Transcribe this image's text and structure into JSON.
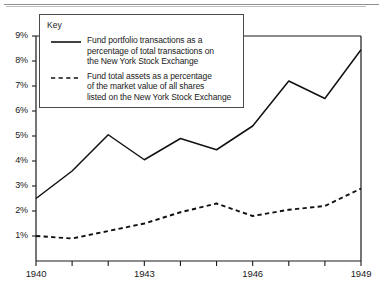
{
  "chart_data": {
    "type": "line",
    "title": "",
    "subtitle": "",
    "xlabel": "",
    "ylabel": "",
    "xlim": [
      1940,
      1949
    ],
    "ylim": [
      0,
      9
    ],
    "grid": false,
    "legend_position": "top-left",
    "legend_title": "Key",
    "x": [
      1940,
      1941,
      1942,
      1943,
      1944,
      1945,
      1946,
      1947,
      1948,
      1949
    ],
    "x_tick_labels": [
      "1940",
      "1943",
      "1946",
      "1949"
    ],
    "x_tick_values": [
      1940,
      1943,
      1946,
      1949
    ],
    "x_minor_ticks": [
      1941,
      1942,
      1944,
      1945,
      1947,
      1948
    ],
    "y_tick_labels": [
      "1%",
      "2%",
      "3%",
      "4%",
      "5%",
      "6%",
      "7%",
      "8%",
      "9%"
    ],
    "y_tick_values": [
      1,
      2,
      3,
      4,
      5,
      6,
      7,
      8,
      9
    ],
    "series": [
      {
        "name": "Fund portfolio transactions as a percentage of total transactions on the New York Stock Exchange",
        "legend_label": "Fund portfolio transactions as a\npercentage of total transactions on\nthe New York Stock Exchange",
        "style": "solid",
        "color": "#111111",
        "values": [
          2.5,
          3.6,
          5.05,
          4.05,
          4.9,
          4.45,
          5.4,
          7.2,
          6.5,
          8.45
        ]
      },
      {
        "name": "Fund total assets as a percentage of the market value of all shares listed on the New York Stock Exchange",
        "legend_label": "Fund total assets as a percentage\nof the market value of all shares\nlisted on the New York Stock Exchange",
        "style": "dashed",
        "color": "#111111",
        "values": [
          1.0,
          0.9,
          1.2,
          1.5,
          1.95,
          2.3,
          1.8,
          2.05,
          2.2,
          2.9
        ]
      }
    ]
  },
  "axis": {
    "y_ticks": [
      {
        "label": "9%",
        "value": 9
      },
      {
        "label": "8%",
        "value": 8
      },
      {
        "label": "7%",
        "value": 7
      },
      {
        "label": "6%",
        "value": 6
      },
      {
        "label": "5%",
        "value": 5
      },
      {
        "label": "4%",
        "value": 4
      },
      {
        "label": "3%",
        "value": 3
      },
      {
        "label": "2%",
        "value": 2
      },
      {
        "label": "1%",
        "value": 1
      }
    ],
    "x_ticks": [
      {
        "label": "1940",
        "value": 1940
      },
      {
        "label": "1943",
        "value": 1943
      },
      {
        "label": "1946",
        "value": 1946
      },
      {
        "label": "1949",
        "value": 1949
      }
    ]
  },
  "legend": {
    "title": "Key",
    "entries": [
      {
        "style": "solid",
        "text": "Fund portfolio transactions as a\npercentage of total transactions on\nthe New York Stock Exchange"
      },
      {
        "style": "dashed",
        "text": "Fund total assets as a percentage\nof the market value of all shares\nlisted on the New York Stock Exchange"
      }
    ]
  }
}
